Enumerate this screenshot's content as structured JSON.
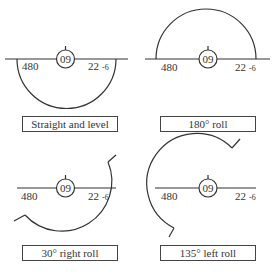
{
  "panels": [
    {
      "caption": "Straight and level",
      "heading": "09",
      "left_value": "480",
      "right_value": "22",
      "right_sub": "-6"
    },
    {
      "caption": "180° roll",
      "heading": "09",
      "left_value": "480",
      "right_value": "22",
      "right_sub": "-6"
    },
    {
      "caption": "30° right roll",
      "heading": "09",
      "left_value": "480",
      "right_value": "22",
      "right_sub": "-6"
    },
    {
      "caption": "135° left roll",
      "heading": "09",
      "left_value": "480",
      "right_value": "22",
      "right_sub": "-6"
    }
  ],
  "colors": {
    "stroke": "#333333",
    "text": "#333333"
  }
}
